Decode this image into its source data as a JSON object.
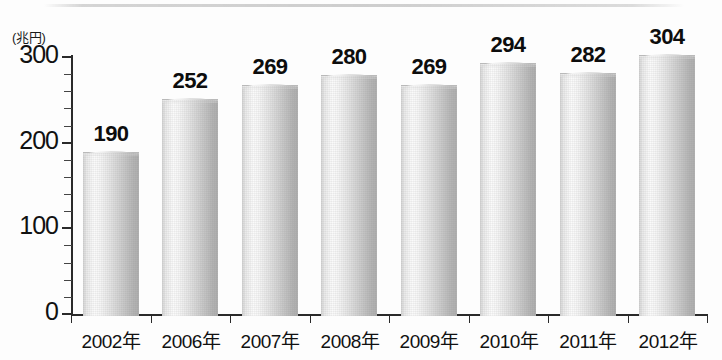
{
  "chart_data": {
    "type": "bar",
    "title": "",
    "subtitle": "",
    "unit_label": "(兆円)",
    "xlabel": "",
    "ylabel": "",
    "categories": [
      "2002年",
      "2006年",
      "2007年",
      "2008年",
      "2009年",
      "2010年",
      "2011年",
      "2012年"
    ],
    "values": [
      190,
      252,
      269,
      280,
      269,
      294,
      282,
      304
    ],
    "value_labels": [
      "190",
      "252",
      "269",
      "280",
      "269",
      "294",
      "282",
      "304"
    ],
    "ylim": [
      0,
      300
    ],
    "y_ticks": [
      0,
      100,
      200,
      300
    ],
    "y_tick_labels": [
      "0",
      "100",
      "200",
      "300"
    ],
    "y_minor_tick_interval": 20,
    "grid": false,
    "legend": null,
    "legend_position": "none",
    "series": [
      {
        "name": "",
        "values": [
          190,
          252,
          269,
          280,
          269,
          294,
          282,
          304
        ]
      }
    ],
    "bar_style": "cylinder-gradient-grayscale",
    "colors": {
      "bar_highlight": "#fbfbfb",
      "bar_mid": "#d2d2d2",
      "bar_shadow": "#aeaeae",
      "axis": "#2a2a2a",
      "text": "#111111",
      "background": "#fdfdfd"
    }
  }
}
